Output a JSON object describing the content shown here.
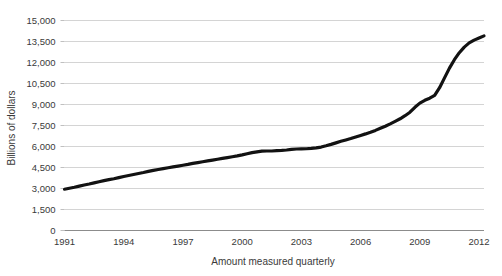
{
  "chart_data": {
    "type": "line",
    "title": "",
    "xlabel": "Amount measured quarterly",
    "ylabel": "Billions of dollars",
    "xlim": [
      1991,
      2012.25
    ],
    "ylim": [
      0,
      15000
    ],
    "grid": true,
    "legend": "none",
    "series_color": "#121212",
    "grid_color": "#c9c9c9",
    "axis_color": "#8c8c8c",
    "text_color": "#3a3a3a",
    "ytick_labels": [
      "15,000",
      "13,500",
      "12,000",
      "10,500",
      "9,000",
      "7,500",
      "6,000",
      "4,500",
      "3,000",
      "1,500",
      "0"
    ],
    "ytick_values": [
      15000,
      13500,
      12000,
      10500,
      9000,
      7500,
      6000,
      4500,
      3000,
      1500,
      0
    ],
    "xtick_labels": [
      "1991",
      "1994",
      "1997",
      "2000",
      "2003",
      "2006",
      "2009",
      "2012"
    ],
    "xtick_values": [
      1991,
      1994,
      1997,
      2000,
      2003,
      2006,
      2009,
      2012
    ],
    "series": [
      {
        "name": "Amount measured quarterly",
        "x": [
          1991.0,
          1991.25,
          1991.5,
          1991.75,
          1992.0,
          1992.25,
          1992.5,
          1992.75,
          1993.0,
          1993.25,
          1993.5,
          1993.75,
          1994.0,
          1994.25,
          1994.5,
          1994.75,
          1995.0,
          1995.25,
          1995.5,
          1995.75,
          1996.0,
          1996.25,
          1996.5,
          1996.75,
          1997.0,
          1997.25,
          1997.5,
          1997.75,
          1998.0,
          1998.25,
          1998.5,
          1998.75,
          1999.0,
          1999.25,
          1999.5,
          1999.75,
          2000.0,
          2000.25,
          2000.5,
          2000.75,
          2001.0,
          2001.25,
          2001.5,
          2001.75,
          2002.0,
          2002.25,
          2002.5,
          2002.75,
          2003.0,
          2003.25,
          2003.5,
          2003.75,
          2004.0,
          2004.25,
          2004.5,
          2004.75,
          2005.0,
          2005.25,
          2005.5,
          2005.75,
          2006.0,
          2006.25,
          2006.5,
          2006.75,
          2007.0,
          2007.25,
          2007.5,
          2007.75,
          2008.0,
          2008.25,
          2008.5,
          2008.75,
          2009.0,
          2009.25,
          2009.5,
          2009.75,
          2010.0,
          2010.25,
          2010.5,
          2010.75,
          2011.0,
          2011.25,
          2011.5,
          2011.75,
          2012.0,
          2012.25
        ],
        "values": [
          2950,
          3020,
          3090,
          3170,
          3250,
          3320,
          3400,
          3480,
          3560,
          3630,
          3700,
          3780,
          3860,
          3930,
          4000,
          4070,
          4140,
          4220,
          4290,
          4360,
          4420,
          4480,
          4540,
          4600,
          4660,
          4720,
          4790,
          4850,
          4910,
          4970,
          5030,
          5090,
          5150,
          5210,
          5270,
          5330,
          5400,
          5480,
          5560,
          5620,
          5670,
          5680,
          5680,
          5700,
          5720,
          5750,
          5800,
          5820,
          5830,
          5840,
          5860,
          5900,
          5960,
          6050,
          6150,
          6260,
          6370,
          6470,
          6570,
          6680,
          6790,
          6900,
          7020,
          7150,
          7300,
          7450,
          7620,
          7800,
          7980,
          8200,
          8450,
          8800,
          9100,
          9300,
          9450,
          9650,
          10200,
          10900,
          11600,
          12200,
          12700,
          13100,
          13400,
          13600,
          13750,
          13900
        ]
      }
    ]
  }
}
